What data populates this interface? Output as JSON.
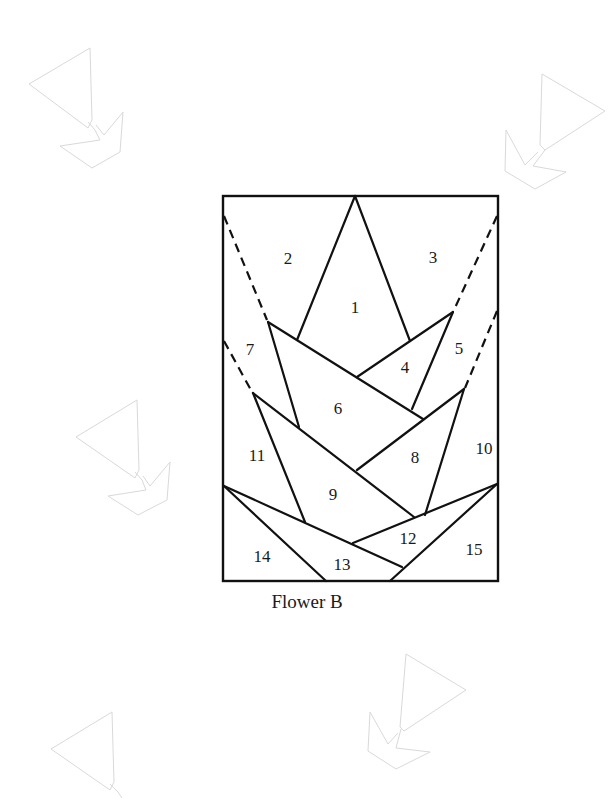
{
  "diagram": {
    "title": "Flower B",
    "type": "foundation paper piecing pattern",
    "frame": {
      "x": 223,
      "y": 196,
      "width": 275,
      "height": 385
    },
    "pieces": [
      {
        "id": "1",
        "label": "1",
        "x": 355,
        "y": 309
      },
      {
        "id": "2",
        "label": "2",
        "x": 288,
        "y": 265
      },
      {
        "id": "3",
        "label": "3",
        "x": 433,
        "y": 263
      },
      {
        "id": "4",
        "label": "4",
        "x": 405,
        "y": 373
      },
      {
        "id": "5",
        "label": "5",
        "x": 459,
        "y": 354
      },
      {
        "id": "6",
        "label": "6",
        "x": 338,
        "y": 415
      },
      {
        "id": "7",
        "label": "7",
        "x": 250,
        "y": 355
      },
      {
        "id": "8",
        "label": "8",
        "x": 415,
        "y": 464
      },
      {
        "id": "9",
        "label": "9",
        "x": 333,
        "y": 501
      },
      {
        "id": "10",
        "label": "10",
        "x": 484,
        "y": 454
      },
      {
        "id": "11",
        "label": "11",
        "x": 257,
        "y": 462
      },
      {
        "id": "12",
        "label": "12",
        "x": 408,
        "y": 545
      },
      {
        "id": "13",
        "label": "13",
        "x": 342,
        "y": 571
      },
      {
        "id": "14",
        "label": "14",
        "x": 262,
        "y": 563
      },
      {
        "id": "15",
        "label": "15",
        "x": 474,
        "y": 556
      }
    ],
    "caption": "Flower B"
  },
  "colors": {
    "line": "#111111",
    "watermark": "#d9d9d9",
    "background": "#ffffff"
  }
}
